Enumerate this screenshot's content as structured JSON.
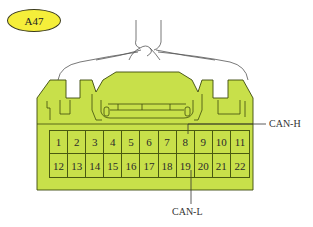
{
  "connector": {
    "id": "A47",
    "body_color": "#C8E04A",
    "outline_color": "#3c4a0c",
    "tag_color": "#F5EE3A"
  },
  "pins": {
    "row1": [
      "1",
      "2",
      "3",
      "4",
      "5",
      "6",
      "7",
      "8",
      "9",
      "10",
      "11"
    ],
    "row2": [
      "12",
      "13",
      "14",
      "15",
      "16",
      "17",
      "18",
      "19",
      "20",
      "21",
      "22"
    ]
  },
  "signals": [
    {
      "name": "CAN-H",
      "pin": "8"
    },
    {
      "name": "CAN-L",
      "pin": "19"
    }
  ]
}
